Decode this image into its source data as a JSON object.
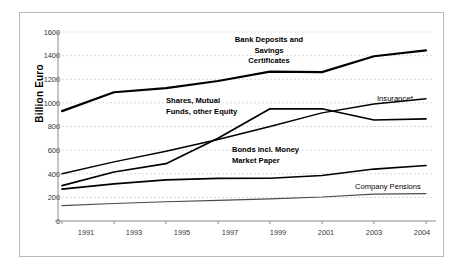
{
  "chart_data": {
    "type": "line",
    "title": "",
    "xlabel": "",
    "ylabel": "Billion Euro",
    "categories": [
      "1991",
      "1993",
      "1995",
      "1997",
      "1999",
      "2001",
      "2003",
      "2004"
    ],
    "ylim": [
      0,
      1600
    ],
    "ytick_step": 200,
    "yticks": [
      "1600",
      "1400",
      "1200",
      "1000",
      "800",
      "600",
      "400",
      "200",
      "0"
    ],
    "grid": true,
    "grid_style": "dashed-horizontal",
    "legend": "inline-annotations",
    "series": [
      {
        "name": "Bank Deposits and Savings Certificates",
        "label_lines": [
          "Bank Deposits and",
          "Savings",
          "Certificates"
        ],
        "values": [
          930,
          1090,
          1125,
          1185,
          1265,
          1260,
          1395,
          1445
        ],
        "color": "#000000",
        "width": 2.2
      },
      {
        "name": "Shares, Mutual Funds, other Equity",
        "label_lines": [
          "Shares, Mutual",
          "Funds, other Equity"
        ],
        "values": [
          300,
          415,
          485,
          700,
          950,
          950,
          855,
          865
        ],
        "color": "#000000",
        "width": 1.7
      },
      {
        "name": "Insurance*",
        "label_lines": [
          "Insurance*"
        ],
        "values": [
          400,
          500,
          590,
          690,
          800,
          915,
          990,
          1035
        ],
        "color": "#000000",
        "width": 1.4
      },
      {
        "name": "Bonds incl. Money Market Paper",
        "label_lines": [
          "Bonds incl. Money",
          "Market Paper"
        ],
        "values": [
          270,
          315,
          348,
          360,
          362,
          385,
          440,
          470
        ],
        "color": "#000000",
        "width": 1.7
      },
      {
        "name": "Company Pensions",
        "label_lines": [
          "Company Pensions"
        ],
        "values": [
          130,
          148,
          163,
          175,
          188,
          203,
          228,
          232
        ],
        "color": "#4a4a4a",
        "width": 1.2
      }
    ],
    "annotations": [
      {
        "id": "bank-deposits",
        "text": "Bank Deposits and Savings Certificates"
      },
      {
        "id": "shares",
        "text": "Shares, Mutual Funds, other Equity"
      },
      {
        "id": "insurance",
        "text": "Insurance*"
      },
      {
        "id": "bonds",
        "text": "Bonds incl. Money Market Paper"
      },
      {
        "id": "pensions",
        "text": "Company Pensions"
      }
    ]
  },
  "axis": {
    "y_title": "Billion Euro",
    "y_ticks": [
      "1600",
      "1400",
      "1200",
      "1000",
      "800",
      "600",
      "400",
      "200",
      "0"
    ],
    "x_ticks": [
      "1991",
      "1993",
      "1995",
      "1997",
      "1999",
      "2001",
      "2003",
      "2004"
    ]
  },
  "labels": {
    "bank_line1": "Bank Deposits and",
    "bank_line2": "Savings",
    "bank_line3": "Certificates",
    "shares_line1": "Shares, Mutual",
    "shares_line2": "Funds, other Equity",
    "insurance": "Insurance*",
    "bonds_line1": "Bonds incl. Money",
    "bonds_line2": "Market Paper",
    "pensions": "Company Pensions"
  },
  "colors": {
    "background": "#ffffff",
    "frame_border": "#b9b9b9",
    "axis": "#808080",
    "grid": "#c8c8c8",
    "series_primary": "#000000",
    "series_light": "#4a4a4a",
    "tick_text": "#3a3a3a"
  }
}
